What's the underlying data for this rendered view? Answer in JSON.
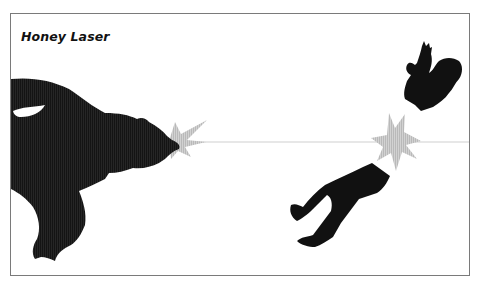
{
  "title": "Honey Laser",
  "scene": {
    "subjects": [
      "bear-silhouette",
      "laser-beam",
      "muzzle-flash",
      "impact-burst",
      "person-upper-body-silhouette",
      "person-lower-body-silhouette"
    ],
    "colors": {
      "silhouette": "#111111",
      "beam": "#c8c8c8",
      "burst": "#c9c9c9",
      "frame_border": "#7a7a7a",
      "background": "#ffffff"
    }
  }
}
